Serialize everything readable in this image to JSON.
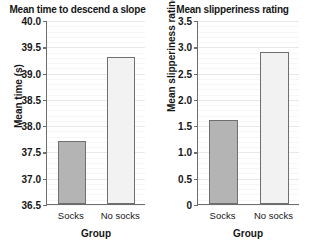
{
  "figure": {
    "width": 310,
    "height": 246,
    "background": "#ffffff"
  },
  "colors": {
    "socks_bar_fill": "#b4b4b4",
    "no_socks_bar_fill": "#f2f2f2",
    "bar_edge": "#6f6f6f",
    "axis": "#6d6d6d",
    "gridline": "#e8e8e8",
    "text": "#161616"
  },
  "chart_data": [
    {
      "type": "bar",
      "id": "mean-time",
      "title": "Mean time to descend a slope",
      "xlabel": "Group",
      "ylabel": "Mean time (s)",
      "categories": [
        "Socks",
        "No socks"
      ],
      "values": [
        37.7,
        39.3
      ],
      "ylim": [
        36.5,
        40.0
      ],
      "yticks": [
        "36.5",
        "37.0",
        "37.5",
        "38.0",
        "38.5",
        "39.0",
        "39.5",
        "40.0"
      ],
      "ytick_values": [
        36.5,
        37.0,
        37.5,
        38.0,
        38.5,
        39.0,
        39.5,
        40.0
      ],
      "ytick_step": 0.5,
      "minor_step": 0.1,
      "grid": true,
      "legend": "none",
      "bar_colors": [
        "#b4b4b4",
        "#f2f2f2"
      ]
    },
    {
      "type": "bar",
      "id": "mean-slipperiness",
      "title": "Mean slipperiness rating",
      "xlabel": "Group",
      "ylabel": "Mean slipperiness rating",
      "categories": [
        "Socks",
        "No socks"
      ],
      "values": [
        1.6,
        2.9
      ],
      "ylim": [
        0,
        3.5
      ],
      "yticks": [
        "0",
        "0.5",
        "1.0",
        "1.5",
        "2.0",
        "2.5",
        "3.0",
        "3.5"
      ],
      "ytick_values": [
        0,
        0.5,
        1.0,
        1.5,
        2.0,
        2.5,
        3.0,
        3.5
      ],
      "ytick_step": 0.5,
      "minor_step": 0.1,
      "grid": true,
      "legend": "none",
      "bar_colors": [
        "#b4b4b4",
        "#f2f2f2"
      ]
    }
  ]
}
